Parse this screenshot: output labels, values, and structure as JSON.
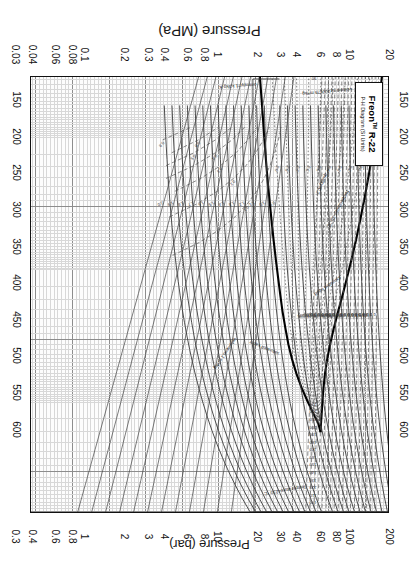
{
  "document": {
    "kind": "pressure-enthalpy-diagram",
    "orientation_note": "rotated-180"
  },
  "title_block": {
    "product": "Freon",
    "trademark": "TM",
    "grade": "R-22",
    "subtitle": "P-H Diagram (SI Units)"
  },
  "axes": {
    "enthalpy": {
      "label": "Enthalpy (kJ/kg)",
      "unit": "kJ/kg",
      "ticks": [
        150,
        200,
        250,
        300,
        350,
        400,
        450,
        500,
        550,
        600
      ],
      "min": 120,
      "max": 610
    },
    "pressure_mpa": {
      "label": "Pressure (MPa)",
      "unit": "MPa",
      "ticks": [
        "20",
        "10",
        "8",
        "6",
        "4",
        "3",
        "2",
        "1",
        "0.8",
        "0.6",
        "0.4",
        "0.3",
        "0.2",
        "0.1",
        "0.08",
        "0.06",
        "0.04",
        "0.03",
        "0.02",
        "0.01"
      ],
      "min": 0.01,
      "max": 20,
      "scale": "log"
    },
    "pressure_bar": {
      "label": "Pressure (bar)",
      "unit": "bar",
      "ticks": [
        "200",
        "100",
        "80",
        "60",
        "40",
        "30",
        "20",
        "10",
        "8",
        "6",
        "4",
        "3",
        "2",
        "1",
        "0.8",
        "0.6",
        "0.4",
        "0.3",
        "0.2",
        "0.1"
      ],
      "min": 0.1,
      "max": 200,
      "scale": "log"
    }
  },
  "chart_data": {
    "type": "line",
    "xlabel": "Enthalpy (kJ/kg)",
    "ylabel": "Pressure (MPa)",
    "secondary_ylabel": "Pressure (bar)",
    "xlim": [
      120,
      610
    ],
    "ylim": [
      0.01,
      20
    ],
    "yscale": "log",
    "grid": true,
    "legend_position": "none",
    "annotations": [
      "saturated liquid",
      "saturated vapor",
      "Temperature=230 °C",
      "Temperature=-10 °C",
      "volume=0.1 m³/kg",
      "volume=0.000675 m³/kg",
      "entropy=1 kJ/kg·K",
      "quality=0.2"
    ],
    "series": [
      {
        "name": "saturated liquid",
        "kind": "dome-left",
        "style": "heavy-solid",
        "label": "saturated liquid"
      },
      {
        "name": "saturated vapor",
        "kind": "dome-right",
        "style": "heavy-solid",
        "label": "saturated vapor"
      },
      {
        "name": "isotherms",
        "kind": "temperature",
        "unit": "°C",
        "style": "solid",
        "lead_label": "Temperature=230 °C",
        "values": [
          230,
          220,
          210,
          200,
          190,
          180,
          170,
          160,
          150,
          140,
          130,
          120,
          110,
          100,
          90,
          80,
          70,
          60,
          50,
          40,
          30,
          20,
          10,
          0,
          -10,
          -20,
          -30,
          -40
        ]
      },
      {
        "name": "isochors-vapor",
        "kind": "specific-volume",
        "unit": "m³/kg",
        "style": "dashed",
        "lead_label": "volume=0.1 m³/kg",
        "values": [
          0.1,
          0.2,
          0.3,
          0.4,
          0.5,
          0.6,
          0.8,
          1.0,
          2.0
        ]
      },
      {
        "name": "isochors-liquid",
        "kind": "specific-volume",
        "unit": "m³/kg",
        "style": "dashed",
        "lead_label": "volume=0.000675 m³/kg",
        "values": [
          0.0015,
          0.0014,
          0.0013,
          0.0012,
          0.0011,
          0.001,
          0.00095,
          0.0009,
          0.000875,
          0.00085,
          0.000825,
          0.0008,
          0.000775,
          0.00075,
          0.000725,
          0.0007,
          0.000675,
          0.00065
        ]
      },
      {
        "name": "isentropes",
        "kind": "entropy",
        "unit": "kJ/kg·K",
        "style": "solid",
        "lead_label": "entropy=1 kJ/kg·K",
        "values": [
          0.9,
          1.0,
          1.1,
          1.2,
          1.3,
          1.4,
          1.5,
          1.6,
          1.7,
          1.8,
          1.9,
          2.0
        ]
      },
      {
        "name": "quality-lines",
        "kind": "quality",
        "unit": "fraction",
        "style": "dotted",
        "lead_label": "quality=0.2",
        "values": [
          0.1,
          0.2,
          0.3,
          0.4,
          0.5,
          0.6,
          0.7,
          0.8,
          0.9
        ]
      }
    ]
  }
}
